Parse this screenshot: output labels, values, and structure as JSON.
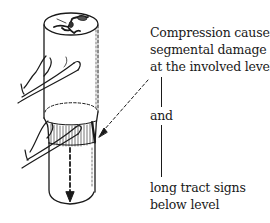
{
  "figure": {
    "stroke_color": "#1a1a1a",
    "background": "#ffffff"
  },
  "annotations": {
    "line1": "Compression causes",
    "line2": "segmental damage",
    "line3": "at the involved level",
    "connector": "and",
    "line4": "long tract signs",
    "line5": "below level"
  }
}
